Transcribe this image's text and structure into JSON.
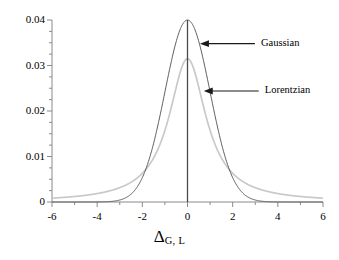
{
  "chart_data": {
    "type": "line",
    "title": "",
    "xlabel": "Δ",
    "xlabel_sub": "G, L",
    "ylabel": "",
    "xlim": [
      -6,
      6
    ],
    "ylim": [
      0,
      0.04
    ],
    "grid": false,
    "legend_position": "inline-annotations",
    "x_ticks": [
      -6,
      -4,
      -2,
      0,
      2,
      4,
      6
    ],
    "x_tick_labels": [
      "-6",
      "-4",
      "-2",
      "0",
      "2",
      "4",
      "6"
    ],
    "x_minor_tick_step": 1,
    "y_ticks": [
      0,
      0.01,
      0.02,
      0.03,
      0.04
    ],
    "y_tick_labels": [
      "0",
      "0.01",
      "0.02",
      "0.03",
      "0.04"
    ],
    "y_minor_tick_step": 0.0025,
    "series": [
      {
        "name": "Gaussian",
        "color": "#585858",
        "peak": 0.04,
        "center": 0,
        "sigma": 0.9974,
        "x": [
          -6,
          -5.5,
          -5,
          -4.5,
          -4,
          -3.5,
          -3,
          -2.75,
          -2.5,
          -2.25,
          -2,
          -1.75,
          -1.5,
          -1.25,
          -1,
          -0.75,
          -0.5,
          -0.25,
          0,
          0.25,
          0.5,
          0.75,
          1,
          1.25,
          1.5,
          1.75,
          2,
          2.25,
          2.5,
          2.75,
          3,
          3.5,
          4,
          4.5,
          5,
          5.5,
          6
        ],
        "values": [
          0.0,
          0.0,
          0.0,
          0.0,
          0.0001,
          0.0002,
          0.0004,
          0.0009,
          0.0018,
          0.0033,
          0.0054,
          0.0084,
          0.0127,
          0.0176,
          0.0243,
          0.0306,
          0.0353,
          0.0388,
          0.04,
          0.0388,
          0.0353,
          0.0306,
          0.0243,
          0.0176,
          0.0127,
          0.0084,
          0.0054,
          0.0033,
          0.0018,
          0.0009,
          0.0004,
          0.0002,
          0.0001,
          0.0,
          0.0,
          0.0,
          0.0
        ]
      },
      {
        "name": "Lorentzian",
        "color": "#c9c9c9",
        "peak": 0.0315,
        "center": 0,
        "hwhm": 1.0,
        "x": [
          -6,
          -5.5,
          -5,
          -4.5,
          -4,
          -3.5,
          -3,
          -2.75,
          -2.5,
          -2.25,
          -2,
          -1.75,
          -1.5,
          -1.25,
          -1,
          -0.75,
          -0.5,
          -0.25,
          0,
          0.25,
          0.5,
          0.75,
          1,
          1.25,
          1.5,
          1.75,
          2,
          2.25,
          2.5,
          2.75,
          3,
          3.5,
          4,
          4.5,
          5,
          5.5,
          6
        ],
        "values": [
          0.00085,
          0.00101,
          0.00121,
          0.00148,
          0.00185,
          0.00238,
          0.00315,
          0.00365,
          0.00428,
          0.00506,
          0.0063,
          0.00762,
          0.00969,
          0.01225,
          0.01575,
          0.02016,
          0.0252,
          0.02965,
          0.0315,
          0.02965,
          0.0252,
          0.02016,
          0.01575,
          0.01225,
          0.00969,
          0.00762,
          0.0063,
          0.00506,
          0.00428,
          0.00365,
          0.00315,
          0.00238,
          0.00185,
          0.00148,
          0.00121,
          0.00101,
          0.00085
        ]
      }
    ],
    "annotations": [
      {
        "name": "Gaussian",
        "label": "Gaussian",
        "arrow": "left",
        "target_x": 0.55,
        "target_y": 0.0348
      },
      {
        "name": "Lorentzian",
        "label": "Lorentzian",
        "arrow": "left",
        "target_x": 0.72,
        "target_y": 0.0244
      }
    ],
    "center_line": {
      "x": 0,
      "from_y": 0,
      "to_y": 0.04,
      "color": "#444444"
    }
  },
  "axis_colors": {
    "axis_line": "#808080",
    "tick": "#808080",
    "text": "#000000"
  }
}
